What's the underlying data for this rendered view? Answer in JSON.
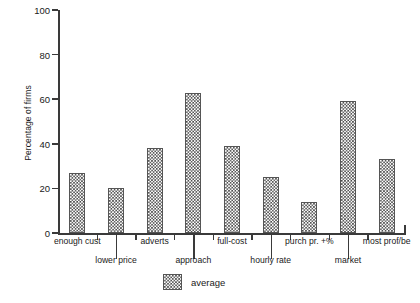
{
  "chart_data": {
    "type": "bar",
    "title": "",
    "xlabel": "",
    "ylabel": "Percentage of firms",
    "ylim": [
      0,
      100
    ],
    "yticks": [
      0,
      20,
      40,
      60,
      80,
      100
    ],
    "ytick_labels": [
      "0",
      "20",
      "40",
      "60",
      "80",
      "100"
    ],
    "grid": false,
    "legend_position": "bottom-center",
    "series_name": "average",
    "categories": [
      "enough cust",
      "lower price",
      "adverts",
      "approach",
      "full-cost",
      "hourly rate",
      "purch pr. +%",
      "market",
      "most prof/be"
    ],
    "values": [
      27,
      20,
      38,
      63,
      39,
      25,
      14,
      59,
      33
    ],
    "series": [
      {
        "name": "average",
        "values": [
          27,
          20,
          38,
          63,
          39,
          25,
          14,
          59,
          33
        ]
      }
    ]
  },
  "legend": {
    "entries": [
      {
        "label": "average",
        "swatch": "checkerboard-pattern"
      }
    ]
  },
  "axes": {
    "y_title": "Percentage of firms"
  }
}
